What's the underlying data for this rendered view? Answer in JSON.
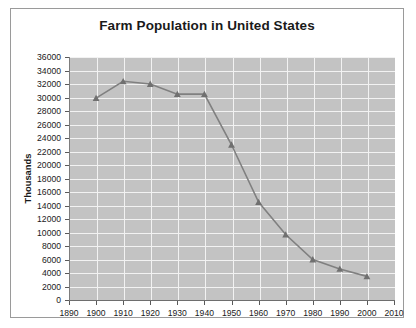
{
  "chart_data": {
    "type": "line",
    "title": "Farm Population in United States",
    "xlabel": "",
    "ylabel": "Thousands",
    "x": [
      1900,
      1910,
      1920,
      1930,
      1940,
      1950,
      1960,
      1970,
      1980,
      1990,
      2000
    ],
    "values": [
      29900,
      32400,
      32000,
      30500,
      30500,
      23000,
      14500,
      9700,
      6000,
      4600,
      3500
    ],
    "series": [
      {
        "name": "Farm Population",
        "values": [
          29900,
          32400,
          32000,
          30500,
          30500,
          23000,
          14500,
          9700,
          6000,
          4600,
          3500
        ]
      }
    ],
    "xlim": [
      1890,
      2010
    ],
    "ylim": [
      0,
      36000
    ],
    "x_ticks": [
      1890,
      1900,
      1910,
      1920,
      1930,
      1940,
      1950,
      1960,
      1970,
      1980,
      1990,
      2000,
      2010
    ],
    "x_tick_labels": [
      "1890",
      "1900",
      "1910",
      "1920",
      "1930",
      "1940",
      "1950",
      "1960",
      "1970",
      "1980",
      "1990",
      "2000",
      "2010"
    ],
    "y_ticks": [
      0,
      2000,
      4000,
      6000,
      8000,
      10000,
      12000,
      14000,
      16000,
      18000,
      20000,
      22000,
      24000,
      26000,
      28000,
      30000,
      32000,
      34000,
      36000
    ],
    "y_tick_labels": [
      "0",
      "2000",
      "4000",
      "6000",
      "8000",
      "10000",
      "12000",
      "14000",
      "16000",
      "18000",
      "20000",
      "22000",
      "24000",
      "26000",
      "28000",
      "30000",
      "32000",
      "34000",
      "36000"
    ],
    "grid": true,
    "legend": false,
    "marker": "triangle",
    "line_color": "#808080",
    "marker_color": "#707070",
    "plot_background": "#c3c3c3",
    "gridline_color": "#f2f2f2"
  },
  "chart": {
    "title": "Farm Population in United States",
    "y_axis_title": "Thousands"
  }
}
